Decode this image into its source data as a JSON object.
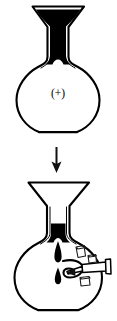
{
  "figure": {
    "width": 117,
    "height": 321,
    "background_color": "#ffffff",
    "ink_color": "#000000"
  },
  "panels": [
    {
      "id": "panel-top",
      "name": "flask-before",
      "caption_symbol": "(+)",
      "apparatus": "round-bottom flask with funnel neck",
      "neck_contents": "black liquid",
      "bulb_contents": "empty",
      "liquid_color": "#000000"
    },
    {
      "id": "panel-bottom",
      "name": "flask-after",
      "apparatus": "round-bottom flask with side-arm and syringe",
      "neck_contents": "black liquid draining",
      "bulb_contents": "falling droplets",
      "droplet_count": 2,
      "crystal_count": 3,
      "liquid_color": "#000000"
    }
  ],
  "arrow": {
    "name": "process-arrow",
    "direction": "down",
    "label": "",
    "color": "#111111"
  },
  "syringe": {
    "name": "syringe",
    "direction": "pointing-left",
    "label": "",
    "color": "#ffffff"
  },
  "labels": {
    "plus_sign": "(+)"
  }
}
